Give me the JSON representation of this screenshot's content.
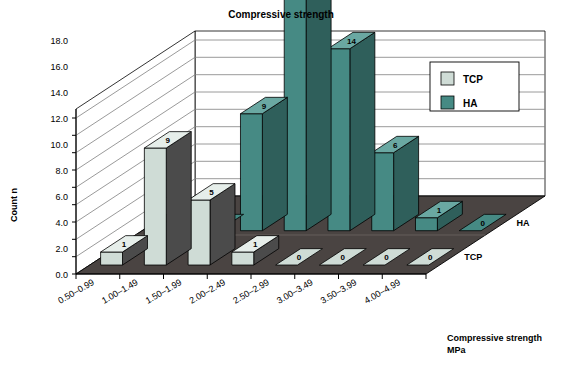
{
  "chart_data": {
    "type": "bar",
    "title": "Compressive strength",
    "xlabel": "Compressive strength MPa",
    "ylabel": "Count n",
    "zlabels": [
      "HA",
      "TCP"
    ],
    "categories": [
      "0.50–0.99",
      "1.00–1.49",
      "1.50–1.99",
      "2.00–2.49",
      "2.50–2.99",
      "3.00–3.49",
      "3.50–3.99",
      "4.00–4.99"
    ],
    "series": [
      {
        "name": "TCP",
        "color": "#cfdcd6",
        "values": [
          1,
          9,
          5,
          1,
          0,
          0,
          0,
          0
        ]
      },
      {
        "name": "HA",
        "color": "#468a84",
        "values": [
          0,
          0,
          9,
          18,
          14,
          6,
          1,
          0
        ]
      }
    ],
    "yticks": [
      "0.0",
      "2.0",
      "4.0",
      "6.0",
      "8.0",
      "10.0",
      "12.0",
      "14.0",
      "16.0",
      "18.0"
    ],
    "ylim": [
      0,
      19
    ],
    "grid": true,
    "legend_position": "right",
    "legend_entries": [
      {
        "label": "TCP",
        "color": "#cfdcd6"
      },
      {
        "label": "HA",
        "color": "#468a84"
      }
    ]
  },
  "axis": {
    "y_title": "Count n",
    "x_title_line1": "Compressive strength",
    "x_title_line2": "MPa"
  },
  "colors": {
    "tcp_face": "#cfdcd6",
    "tcp_side": "#4b4b4b",
    "tcp_top": "#e6eeea",
    "ha_face": "#468a84",
    "ha_side": "#2f5f5b",
    "ha_top": "#6aa8a2",
    "floor": "#4a4442",
    "wall": "#ffffff",
    "grid_line": "#808080",
    "outline": "#000000"
  }
}
